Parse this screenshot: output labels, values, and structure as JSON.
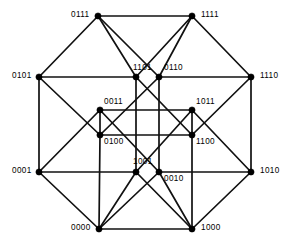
{
  "figure": {
    "width": 289,
    "height": 247,
    "background_color": "#ffffff",
    "edge_color": "#111111",
    "vertex_color": "#000000",
    "label_color": "#000000"
  },
  "vertices": [
    {
      "label": "0111",
      "x": 98,
      "y": 16,
      "lx": 71,
      "ly": 11,
      "anchor": "right"
    },
    {
      "label": "1111",
      "x": 192,
      "y": 16,
      "lx": 201,
      "ly": 11,
      "anchor": "left"
    },
    {
      "label": "0101",
      "x": 39,
      "y": 77,
      "lx": 12,
      "ly": 72,
      "anchor": "right"
    },
    {
      "label": "1110",
      "x": 251,
      "y": 77,
      "lx": 260,
      "ly": 72,
      "anchor": "left"
    },
    {
      "label": "0001",
      "x": 39,
      "y": 172,
      "lx": 12,
      "ly": 167,
      "anchor": "right"
    },
    {
      "label": "1010",
      "x": 251,
      "y": 172,
      "lx": 260,
      "ly": 167,
      "anchor": "left"
    },
    {
      "label": "0000",
      "x": 99,
      "y": 229,
      "lx": 71,
      "ly": 224,
      "anchor": "right"
    },
    {
      "label": "1000",
      "x": 192,
      "y": 229,
      "lx": 201,
      "ly": 224,
      "anchor": "left"
    },
    {
      "label": "1101",
      "x": 136,
      "y": 77,
      "lx": 133,
      "ly": 64,
      "anchor": "right"
    },
    {
      "label": "0110",
      "x": 159,
      "y": 77,
      "lx": 164,
      "ly": 64,
      "anchor": "left"
    },
    {
      "label": "0011",
      "x": 100,
      "y": 110,
      "lx": 104,
      "ly": 98,
      "anchor": "left"
    },
    {
      "label": "1011",
      "x": 192,
      "y": 110,
      "lx": 196,
      "ly": 98,
      "anchor": "left"
    },
    {
      "label": "0100",
      "x": 100,
      "y": 135,
      "lx": 104,
      "ly": 138,
      "anchor": "left"
    },
    {
      "label": "1100",
      "x": 192,
      "y": 135,
      "lx": 196,
      "ly": 138,
      "anchor": "left"
    },
    {
      "label": "1001",
      "x": 136,
      "y": 172,
      "lx": 133,
      "ly": 158,
      "anchor": "right"
    },
    {
      "label": "0010",
      "x": 159,
      "y": 172,
      "lx": 164,
      "ly": 175,
      "anchor": "left"
    }
  ],
  "edges": [
    {
      "from": "0111",
      "to": "1111"
    },
    {
      "from": "0111",
      "to": "0101"
    },
    {
      "from": "0111",
      "to": "1101"
    },
    {
      "from": "0111",
      "to": "0110"
    },
    {
      "from": "1111",
      "to": "1110"
    },
    {
      "from": "1111",
      "to": "1101"
    },
    {
      "from": "1111",
      "to": "0110"
    },
    {
      "from": "0101",
      "to": "0001"
    },
    {
      "from": "0101",
      "to": "1101"
    },
    {
      "from": "0101",
      "to": "0100"
    },
    {
      "from": "1110",
      "to": "1010"
    },
    {
      "from": "1110",
      "to": "0110"
    },
    {
      "from": "1110",
      "to": "1100"
    },
    {
      "from": "0001",
      "to": "0000"
    },
    {
      "from": "0001",
      "to": "1001"
    },
    {
      "from": "0001",
      "to": "0011"
    },
    {
      "from": "1010",
      "to": "1000"
    },
    {
      "from": "1010",
      "to": "0010"
    },
    {
      "from": "1010",
      "to": "1011"
    },
    {
      "from": "0000",
      "to": "1000"
    },
    {
      "from": "0000",
      "to": "1001"
    },
    {
      "from": "0000",
      "to": "0010"
    },
    {
      "from": "1000",
      "to": "1001"
    },
    {
      "from": "1000",
      "to": "0010"
    },
    {
      "from": "1101",
      "to": "1100"
    },
    {
      "from": "1101",
      "to": "1001"
    },
    {
      "from": "0110",
      "to": "0100"
    },
    {
      "from": "0110",
      "to": "0010"
    },
    {
      "from": "0011",
      "to": "0100"
    },
    {
      "from": "0011",
      "to": "1011"
    },
    {
      "from": "0011",
      "to": "0010"
    },
    {
      "from": "1011",
      "to": "1100"
    },
    {
      "from": "1011",
      "to": "1001"
    },
    {
      "from": "0100",
      "to": "1100"
    },
    {
      "from": "1100",
      "to": "1000"
    },
    {
      "from": "0100",
      "to": "0000"
    }
  ]
}
